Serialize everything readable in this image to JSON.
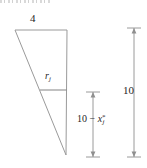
{
  "figure": {
    "stroke_color": "#9a9a9a",
    "text_color": "#262626",
    "background_color": "#ffffff",
    "labels": {
      "top_width": "4",
      "inner_segment": "r",
      "inner_segment_subscript": "j",
      "middle_dimension_prefix": "10 − ",
      "middle_dimension_variable": "x",
      "middle_dimension_superscript": "*",
      "middle_dimension_subscript": "j",
      "right_dimension": "10"
    },
    "shape": {
      "type": "triangle",
      "vertices": [
        [
          15,
          30
        ],
        [
          67,
          30
        ],
        [
          66,
          155
        ]
      ],
      "inner_horizontal_line": {
        "x1": 40,
        "x2": 67,
        "y": 90
      }
    },
    "dimension_lines": [
      {
        "name": "middle",
        "x": 93,
        "y1": 92,
        "y2": 157,
        "label": "10 − x*j"
      },
      {
        "name": "right",
        "x": 134,
        "y1": 28,
        "y2": 157,
        "label": "10"
      }
    ]
  }
}
